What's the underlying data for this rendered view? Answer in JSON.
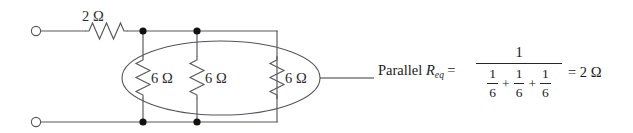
{
  "figure": {
    "kind": "circuit-diagram",
    "title_text": "",
    "series_resistor": {
      "label": "2 Ω",
      "value": 2,
      "unit": "Ω"
    },
    "parallel_resistors": [
      {
        "label": "6 Ω",
        "value": 6,
        "unit": "Ω"
      },
      {
        "label": "6 Ω",
        "value": 6,
        "unit": "Ω"
      },
      {
        "label": "6 Ω",
        "value": 6,
        "unit": "Ω"
      }
    ],
    "annotation": {
      "text_prefix": "Parallel ",
      "symbol": "R",
      "subscript": "eq",
      "equals": "="
    },
    "formula": {
      "numerator": "1",
      "denominator_terms": [
        {
          "num": "1",
          "den": "6"
        },
        {
          "num": "1",
          "den": "6"
        },
        {
          "num": "1",
          "den": "6"
        }
      ],
      "operator": "+",
      "result": "= 2 Ω"
    },
    "colors": {
      "wire": "#57585a",
      "node": "#111111",
      "ellipse": "#54555a",
      "text": "#2c2c2e",
      "background": "#ffffff"
    }
  }
}
